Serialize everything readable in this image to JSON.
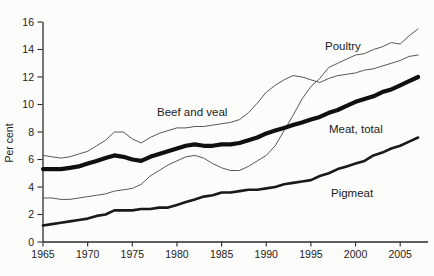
{
  "chart_data": {
    "type": "line",
    "title": "",
    "xlabel": "",
    "ylabel": "Per cent",
    "ylim": [
      0,
      16
    ],
    "xlim": [
      1965,
      2008
    ],
    "grid": false,
    "legend_position": "inline-annotations",
    "y_ticks": [
      0,
      2,
      4,
      6,
      8,
      10,
      12,
      14,
      16
    ],
    "x_ticks": [
      1965,
      1970,
      1975,
      1980,
      1985,
      1990,
      1995,
      2000,
      2005
    ],
    "x": [
      1965,
      1966,
      1967,
      1968,
      1969,
      1970,
      1971,
      1972,
      1973,
      1974,
      1975,
      1976,
      1977,
      1978,
      1979,
      1980,
      1981,
      1982,
      1983,
      1984,
      1985,
      1986,
      1987,
      1988,
      1989,
      1990,
      1991,
      1992,
      1993,
      1994,
      1995,
      1996,
      1997,
      1998,
      1999,
      2000,
      2001,
      2002,
      2003,
      2004,
      2005,
      2006,
      2007
    ],
    "series": [
      {
        "name": "Beef and veal",
        "style": "thin",
        "values": [
          6.3,
          6.2,
          6.1,
          6.2,
          6.4,
          6.6,
          7.0,
          7.4,
          8.0,
          8.0,
          7.5,
          7.2,
          7.6,
          7.9,
          8.1,
          8.3,
          8.3,
          8.4,
          8.4,
          8.5,
          8.6,
          8.7,
          8.9,
          9.4,
          10.1,
          10.9,
          11.4,
          11.8,
          12.1,
          12.0,
          11.8,
          11.6,
          11.9,
          12.1,
          12.2,
          12.3,
          12.5,
          12.6,
          12.8,
          13.0,
          13.2,
          13.5,
          13.6
        ]
      },
      {
        "name": "Poultry",
        "style": "thin",
        "values": [
          3.2,
          3.2,
          3.1,
          3.1,
          3.2,
          3.3,
          3.4,
          3.5,
          3.7,
          3.8,
          3.9,
          4.2,
          4.8,
          5.2,
          5.6,
          5.9,
          6.2,
          6.3,
          6.1,
          5.7,
          5.4,
          5.2,
          5.2,
          5.5,
          5.9,
          6.3,
          7.0,
          8.1,
          9.2,
          10.4,
          11.3,
          11.9,
          12.7,
          13.0,
          13.3,
          13.6,
          13.7,
          14.0,
          14.2,
          14.5,
          14.4,
          15.0,
          15.5
        ]
      },
      {
        "name": "Meat, total",
        "style": "thick",
        "values": [
          5.3,
          5.3,
          5.3,
          5.4,
          5.5,
          5.7,
          5.9,
          6.1,
          6.3,
          6.2,
          6.0,
          5.9,
          6.2,
          6.4,
          6.6,
          6.8,
          7.0,
          7.1,
          7.0,
          7.0,
          7.1,
          7.1,
          7.2,
          7.4,
          7.6,
          7.9,
          8.1,
          8.3,
          8.5,
          8.7,
          8.9,
          9.1,
          9.4,
          9.6,
          9.9,
          10.2,
          10.4,
          10.6,
          10.9,
          11.1,
          11.4,
          11.7,
          12.0
        ]
      },
      {
        "name": "Pigmeat",
        "style": "medium",
        "values": [
          1.2,
          1.3,
          1.4,
          1.5,
          1.6,
          1.7,
          1.9,
          2.0,
          2.3,
          2.3,
          2.3,
          2.4,
          2.4,
          2.5,
          2.5,
          2.7,
          2.9,
          3.1,
          3.3,
          3.4,
          3.6,
          3.6,
          3.7,
          3.8,
          3.8,
          3.9,
          4.0,
          4.2,
          4.3,
          4.4,
          4.5,
          4.8,
          5.0,
          5.3,
          5.5,
          5.7,
          5.9,
          6.3,
          6.5,
          6.8,
          7.0,
          7.3,
          7.6
        ]
      }
    ]
  },
  "colors": {
    "background": "#fcfcfb",
    "axis": "#2b2b2b",
    "text": "#222222",
    "line_thin": "#575757",
    "line_medium": "#1a1a1a",
    "line_thick": "#101010"
  }
}
